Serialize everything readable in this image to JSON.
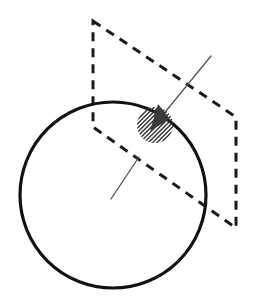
{
  "figure": {
    "canvas": {
      "width": 257,
      "height": 307,
      "background": "#ffffff"
    },
    "colors": {
      "stroke": "#111111",
      "dashed_stroke": "#1a1a1a",
      "thin_stroke": "#555555",
      "hatch": "#333333",
      "background": "#ffffff"
    },
    "elements": {
      "sphere_outline": {
        "label": "sphere-outline-circle",
        "center_x": 113,
        "center_y": 195,
        "radius": 93,
        "stroke_width": 3.2,
        "fill": "none"
      },
      "cutting_plane": {
        "label": "cutting-plane-parallelogram",
        "points": "93,21 236,117 236,228 93,127",
        "stroke_width": 3.0,
        "dash": "9 7",
        "fill": "none"
      },
      "hatched_patch": {
        "label": "hatched-surface-patch-ellipse",
        "center_x": 155,
        "center_y": 125,
        "radius_x": 18,
        "radius_y": 18,
        "rotation_deg": -28,
        "hatch_angle_deg": 45,
        "hatch_spacing": 3,
        "hatch_stroke_width": 1.4
      },
      "normal_line_upper": {
        "label": "normal-vector-line-upper",
        "x1": 211,
        "y1": 56,
        "x2": 157,
        "y2": 122,
        "stroke_width": 1.3
      },
      "normal_arrow_wedge": {
        "label": "normal-vector-arrow-wedge",
        "points": "158,104 170,119 150,131",
        "fill": "#3b3b3b"
      },
      "radius_line_lower": {
        "label": "radius-line-lower",
        "x1": 139,
        "y1": 157,
        "x2": 111,
        "y2": 199,
        "stroke_width": 1.3
      }
    }
  }
}
